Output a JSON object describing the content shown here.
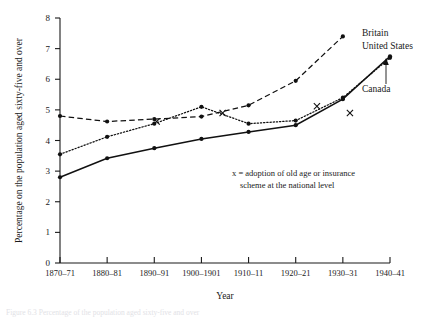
{
  "chart_data": {
    "type": "line",
    "title": "",
    "xlabel": "Year",
    "ylabel": "Percentage on the population aged sixty-five and over",
    "categories": [
      "1870–71",
      "1880–81",
      "1890–91",
      "1900–1901",
      "1910–11",
      "1920–21",
      "1930–31",
      "1940–41"
    ],
    "ylim": [
      0,
      8
    ],
    "xlim": [
      0,
      7
    ],
    "ytick_labels": [
      "0",
      "1",
      "2",
      "3",
      "4",
      "5",
      "6",
      "7",
      "8"
    ],
    "ytick_values": [
      0,
      1,
      2,
      3,
      4,
      5,
      6,
      7,
      8
    ],
    "grid": false,
    "legend_position": "inline-right-labels",
    "series": [
      {
        "name": "Britain",
        "style": "dashed",
        "x": [
          "1870–71",
          "1880–81",
          "1890–91",
          "1900–1901",
          "1910–11",
          "1920–21",
          "1930–31"
        ],
        "values": [
          4.8,
          4.62,
          4.7,
          4.78,
          5.15,
          5.95,
          7.4
        ]
      },
      {
        "name": "United States",
        "style": "dotted",
        "x": [
          "1870–71",
          "1880–81",
          "1890–91",
          "1900–1901",
          "1910–11",
          "1920–21",
          "1930–31",
          "1940–41"
        ],
        "values": [
          3.55,
          4.12,
          4.55,
          5.1,
          4.55,
          4.65,
          5.4,
          6.7
        ]
      },
      {
        "name": "Canada",
        "style": "solid",
        "x": [
          "1870–71",
          "1880–81",
          "1890–91",
          "1900–1901",
          "1910–11",
          "1920–21",
          "1930–31",
          "1940–41"
        ],
        "values": [
          2.8,
          3.42,
          3.75,
          4.05,
          4.28,
          4.5,
          5.35,
          6.75
        ]
      }
    ],
    "annotations": [
      {
        "name": "x-mark-britain-1905",
        "series": "Britain",
        "marker": "x",
        "x_value": 3.45,
        "y_value": 4.9,
        "meaning": "adoption of old age or insurance scheme at the national level"
      },
      {
        "name": "x-mark-britain-1925",
        "series": "Britain",
        "marker": "x",
        "x_value": 5.45,
        "y_value": 5.12,
        "meaning": "adoption of old age or insurance scheme at the national level"
      },
      {
        "name": "x-mark-us-1935",
        "series": "United States",
        "marker": "x",
        "x_value": 6.15,
        "y_value": 4.9,
        "meaning": "adoption of old age or insurance scheme at the national level"
      },
      {
        "name": "x-mark-canada-1927",
        "series": "Canada",
        "marker": "x",
        "x_value": 2.05,
        "y_value": 4.62,
        "meaning": "adoption of old age or insurance scheme at the national level"
      }
    ]
  },
  "axis": {
    "y_title": "Percentage on the population aged sixty-five and over",
    "x_title": "Year"
  },
  "labels": {
    "britain": "Britain",
    "united_states": "United States",
    "canada": "Canada"
  },
  "note": {
    "line1": "x  =  adoption of old age or insurance",
    "line2": "scheme at the national level"
  },
  "caption": {
    "partial": "Figure 6.3  Percentage of the population aged sixty-five and over"
  }
}
